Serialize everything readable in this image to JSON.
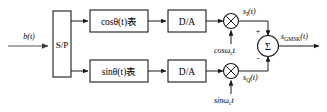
{
  "diagram": {
    "input": {
      "label": "b(t)",
      "label_italic": "b",
      "label_rest": "(t)"
    },
    "blocks": [
      {
        "id": "sp",
        "label": "S/P",
        "name": "serial-to-parallel-block"
      },
      {
        "id": "cos-table",
        "label": "cosθ(t)表",
        "name": "cos-theta-table-block"
      },
      {
        "id": "sin-table",
        "label": "sinθ(t)表",
        "name": "sin-theta-table-block"
      },
      {
        "id": "da-top",
        "label": "D/A",
        "name": "da-converter-top-block"
      },
      {
        "id": "da-bottom",
        "label": "D/A",
        "name": "da-converter-bottom-block"
      }
    ],
    "multipliers": [
      {
        "id": "mult-i",
        "symbol": "⊗",
        "name": "multiplier-inphase"
      },
      {
        "id": "mult-q",
        "symbol": "⊗",
        "name": "multiplier-quadrature"
      }
    ],
    "summer": {
      "symbol": "Σ",
      "plus_sign": "+",
      "minus_sign": "-",
      "name": "summing-junction"
    },
    "carriers": [
      {
        "id": "carrier-cos",
        "base": "cosω",
        "sub": "c",
        "tail": "t",
        "name": "cos-carrier-label"
      },
      {
        "id": "carrier-sin",
        "base": "sinω",
        "sub": "c",
        "tail": "t",
        "name": "sin-carrier-label"
      }
    ],
    "signals": [
      {
        "id": "s-i",
        "base": "s",
        "sub": "I",
        "tail": "(t)",
        "name": "signal-label-si"
      },
      {
        "id": "s-q",
        "base": "s",
        "sub": "Q",
        "tail": "(t)",
        "name": "signal-label-sq"
      },
      {
        "id": "s-gmsk",
        "base": "s",
        "sub": "GMSK",
        "tail": "(t)",
        "name": "signal-label-sgmsk"
      }
    ],
    "colors": {
      "stroke": "#1a1a1a",
      "input_arrow": "#8a8a8a",
      "background": "#ffffff"
    }
  }
}
